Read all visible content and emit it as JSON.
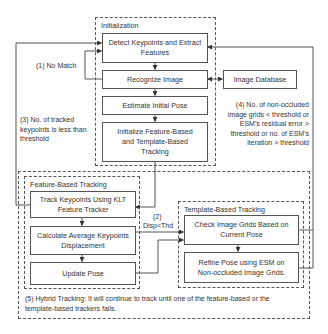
{
  "diagram": {
    "groups": {
      "initialization": "Initialization",
      "feature_based": "Feature-Based Tracking",
      "template_based": "Template-Based Tracking"
    },
    "nodes": {
      "detect": "Detect Keypoints and Extract Features",
      "recognize": "Recognize Image",
      "estimate": "Estimate Initial Pose",
      "initialize": "Initialize Feature-Based and Template-Based Tracking",
      "database": "Image Database",
      "track_klt": "Track Keypoints Using KLT Feature Tracker",
      "calc_disp": "Calculate Average Keypoints Displacement",
      "update_pose": "Update Pose",
      "check_grids": "Check Image Grids Based on Current Pose",
      "refine_pose": "Refine Pose using ESM on Non-occluded Image Grids."
    },
    "annotations": {
      "no_match": "(1) No Match",
      "disp_num": "(2)",
      "disp_cond": "Disp<Thd",
      "tracked_keypoints": "(3) No. of tracked keypoints is less than threshold",
      "non_occluded": "(4) No. of non-occluded image grids < threshold or ESM's residual error > threshold or no. of ESM's iteration > threshold",
      "hybrid": "(5) Hybrid Tracking: It will continue to track until one of the feature-based or the template-based trackers fails."
    },
    "colors": {
      "line": "#555555",
      "text": "#333333",
      "background": "#ffffff"
    }
  }
}
